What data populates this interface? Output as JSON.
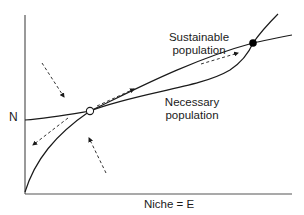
{
  "diagram": {
    "y_axis_label": "N",
    "x_axis_label": "Niche = E",
    "curves": [
      {
        "name": "Sustainable",
        "label_line1": "Sustainable",
        "label_line2": "population"
      },
      {
        "name": "Necessary",
        "label_line1": "Necessary",
        "label_line2": "population"
      }
    ],
    "equilibria": [
      {
        "type": "unstable",
        "marker": "open-circle"
      },
      {
        "type": "stable",
        "marker": "filled-circle"
      }
    ],
    "colors": {
      "line": "#1a1a1a",
      "arrow": "#333333",
      "background": "#ffffff"
    }
  }
}
